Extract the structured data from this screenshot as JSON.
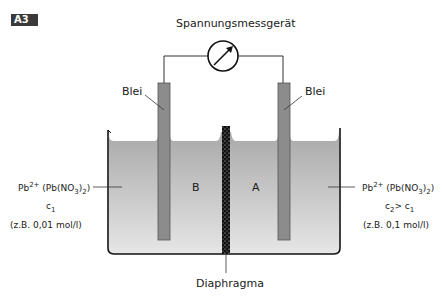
{
  "figure": {
    "badge": "A3",
    "meter_label": "Spannungsmessgerät",
    "left_electrode_label": "Blei",
    "right_electrode_label": "Blei",
    "compartment_left": "B",
    "compartment_right": "A",
    "diaphragm_label": "Diaphragma",
    "left_solution": {
      "ion": "Pb",
      "charge": "2+",
      "salt_open": "(Pb(NO",
      "salt_sub1": "3",
      "salt_mid": ")",
      "salt_sub2": "2",
      "salt_close": ")",
      "conc_symbol": "c",
      "conc_sub": "1",
      "example": "(z.B. 0,01 mol/l)"
    },
    "right_solution": {
      "ion": "Pb",
      "charge": "2+",
      "salt_open": "(Pb(NO",
      "salt_sub1": "3",
      "salt_mid": ")",
      "salt_sub2": "2",
      "salt_close": ")",
      "conc_symbol": "c",
      "conc_sub": "2",
      "conc_relation": "> c",
      "conc_relation_sub": "1",
      "example": "(z.B. 0,1 mol/l)"
    },
    "colors": {
      "liquid_top": "#a8a8a8",
      "liquid_bottom": "#e4e4e4",
      "electrode": "#8c8c8c",
      "outline": "#1a1a1a"
    }
  }
}
